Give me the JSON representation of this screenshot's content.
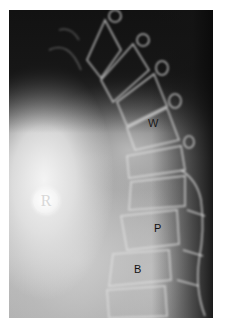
{
  "image": {
    "description": "Lateral radiograph of the spine with labeled vertebral features",
    "side_marker": "R",
    "labels": [
      {
        "id": "w",
        "text": "W"
      },
      {
        "id": "p",
        "text": "P"
      },
      {
        "id": "b",
        "text": "B"
      }
    ]
  }
}
